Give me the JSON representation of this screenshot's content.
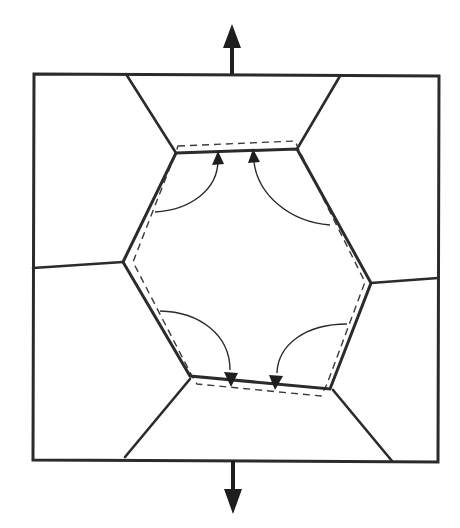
{
  "figure": {
    "colors": {
      "stroke": "#2b2b2b",
      "arrow_fill": "#1e1e1e",
      "background": "#ffffff"
    },
    "load_arrows": [
      {
        "id": "top",
        "direction": "up",
        "icon": "arrow-up-icon"
      },
      {
        "id": "bottom",
        "direction": "down",
        "icon": "arrow-down-icon"
      }
    ],
    "outer_frame": {
      "corners": [
        [
          34,
          74
        ],
        [
          439,
          76
        ],
        [
          438,
          462
        ],
        [
          33,
          460
        ]
      ]
    },
    "hexagon": {
      "vertices": [
        [
          176,
          153
        ],
        [
          297,
          149
        ],
        [
          371,
          283
        ],
        [
          330,
          389
        ],
        [
          190,
          376
        ],
        [
          123,
          262
        ]
      ]
    },
    "dashed_outline": {
      "vertices": [
        [
          178,
          146
        ],
        [
          295,
          141
        ],
        [
          365,
          282
        ],
        [
          321,
          396
        ],
        [
          197,
          384
        ],
        [
          133,
          262
        ]
      ]
    },
    "grain_boundaries": [
      {
        "from": [
          176,
          153
        ],
        "to": [
          126,
          74
        ]
      },
      {
        "from": [
          297,
          149
        ],
        "to": [
          340,
          76
        ]
      },
      {
        "from": [
          123,
          262
        ],
        "to": [
          33,
          268
        ]
      },
      {
        "from": [
          371,
          283
        ],
        "to": [
          438,
          278
        ]
      },
      {
        "from": [
          190,
          379
        ],
        "to": [
          125,
          457
        ]
      },
      {
        "from": [
          333,
          390
        ],
        "to": [
          392,
          461
        ]
      }
    ],
    "flux_arrows": [
      {
        "id": "flux-top-left",
        "direction": "up",
        "target_face": "top"
      },
      {
        "id": "flux-top-right",
        "direction": "up",
        "target_face": "top"
      },
      {
        "id": "flux-bottom-left",
        "direction": "down",
        "target_face": "bottom"
      },
      {
        "id": "flux-bottom-right",
        "direction": "down",
        "target_face": "bottom"
      }
    ],
    "labels": []
  }
}
